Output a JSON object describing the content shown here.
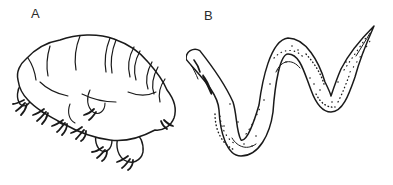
{
  "figure": {
    "background_color": "#ffffff",
    "ink_color": "#1a1a1a",
    "label_color": "#2b2b2b",
    "panels": [
      {
        "label": "A",
        "illustration": "tardigrade-line-drawing"
      },
      {
        "label": "B",
        "illustration": "nematode-line-drawing"
      }
    ]
  }
}
